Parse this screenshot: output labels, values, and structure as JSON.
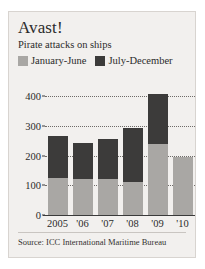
{
  "figure": {
    "title": "Avast!",
    "subtitle": "Pirate attacks on ships",
    "source": "Source: ICC International Maritime Bureau",
    "background_color": "#f2f0ee",
    "series_colors": {
      "january_june": "#a9a7a4",
      "july_december": "#3c3b3a"
    }
  },
  "legend": {
    "position": "top-left",
    "entries": [
      {
        "label": "January-June",
        "color": "#a9a7a4",
        "swatch_name": "legend-swatch-january-june"
      },
      {
        "label": "July-December",
        "color": "#3c3b3a",
        "swatch_name": "legend-swatch-july-december"
      }
    ]
  },
  "chart_data": {
    "type": "bar",
    "subtype": "stacked",
    "title": "Avast!",
    "subtitle": "Pirate attacks on ships",
    "xlabel": "",
    "ylabel": "",
    "categories": [
      "2005",
      "'06",
      "'07",
      "'08",
      "'09",
      "'10"
    ],
    "series": [
      {
        "name": "January-June",
        "color": "#a9a7a4",
        "values": [
          123,
          122,
          122,
          110,
          240,
          196
        ]
      },
      {
        "name": "July-December",
        "color": "#3c3b3a",
        "values": [
          144,
          120,
          134,
          183,
          166,
          0
        ]
      }
    ],
    "totals": [
      267,
      242,
      256,
      293,
      406,
      196
    ],
    "ylim": [
      0,
      400
    ],
    "yticks": [
      0,
      100,
      200,
      300,
      400
    ],
    "ytick_labels": [
      "0",
      "100",
      "200",
      "300",
      "400"
    ],
    "grid": true,
    "grid_style": "dotted",
    "legend_position": "top-left"
  }
}
